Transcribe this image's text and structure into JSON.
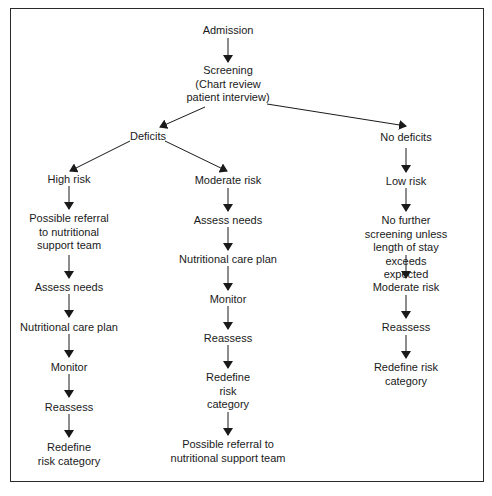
{
  "diagram": {
    "root": "Admission",
    "screening": "Screening\n(Chart review\npatient interview)",
    "deficits": "Deficits",
    "no_deficits": "No deficits",
    "high_risk_branch": {
      "label": "High risk",
      "steps": [
        "Possible referral\nto nutritional\nsupport team",
        "Assess needs",
        "Nutritional care plan",
        "Monitor",
        "Reassess",
        "Redefine\nrisk category"
      ]
    },
    "moderate_risk_branch": {
      "label": "Moderate risk",
      "steps": [
        "Assess needs",
        "Nutritional care plan",
        "Monitor",
        "Reassess",
        "Redefine\nrisk\ncategory",
        "Possible referral to\nnutritional support team"
      ]
    },
    "low_risk_branch": {
      "label": "Low risk",
      "steps": [
        "No further screening unless\nlength of stay exceeds\nexpected",
        "Moderate risk",
        "Reassess",
        "Redefine risk category"
      ]
    }
  }
}
